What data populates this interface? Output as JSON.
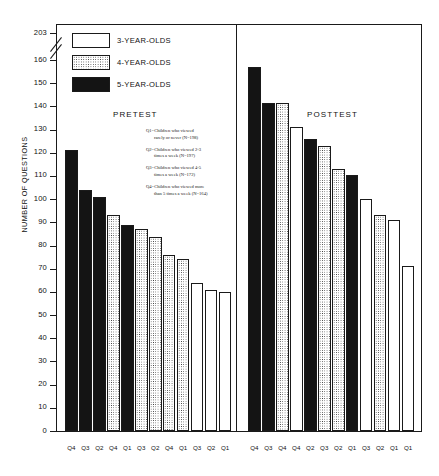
{
  "chart_data": {
    "type": "bar",
    "title": "",
    "xlabel": "",
    "ylabel": "NUMBER OF QUESTIONS",
    "ylim": [
      0,
      160
    ],
    "ytick_step": 10,
    "yticks": [
      "203",
      "160",
      "150",
      "140",
      "130",
      "120",
      "110",
      "100",
      "90",
      "80",
      "70",
      "60",
      "50",
      "40",
      "30",
      "20",
      "10",
      "0"
    ],
    "axis_break_value": "203",
    "grid": false,
    "legend_position": "upper-left-inside",
    "legend": [
      {
        "label": "3-YEAR-OLDS",
        "fill": "white"
      },
      {
        "label": "4-YEAR-OLDS",
        "fill": "dotted"
      },
      {
        "label": "5-YEAR-OLDS",
        "fill": "black"
      }
    ],
    "annotations": [
      {
        "key": "Q1",
        "line1": "Q1=Children who viewed",
        "line2": "rarely or never (N=198)"
      },
      {
        "key": "Q2",
        "line1": "Q2=Children who viewed 2-3",
        "line2": "times a week (N=197)"
      },
      {
        "key": "Q3",
        "line1": "Q3=Children who viewed 4-5",
        "line2": "times a week (N=172)"
      },
      {
        "key": "Q4",
        "line1": "Q4=Children who viewed more",
        "line2": "than 5 times a week (N=164)"
      }
    ],
    "panels": [
      {
        "name": "PRETEST",
        "categories": [
          "Q4",
          "Q3",
          "Q2",
          "Q4",
          "Q1",
          "Q3",
          "Q2",
          "Q4",
          "Q1",
          "Q3",
          "Q2",
          "Q1"
        ],
        "fills": [
          "black",
          "black",
          "black",
          "dotted",
          "black",
          "dotted",
          "dotted",
          "dotted",
          "dotted",
          "white",
          "white",
          "white"
        ],
        "values": [
          121,
          104,
          101,
          93,
          89,
          87,
          83.5,
          76,
          74,
          64,
          61,
          60
        ]
      },
      {
        "name": "POSTTEST",
        "categories": [
          "Q4",
          "Q3",
          "Q4",
          "Q4",
          "Q2",
          "Q3",
          "Q2",
          "Q1",
          "Q3",
          "Q2",
          "Q1",
          "Q1"
        ],
        "fills": [
          "black",
          "black",
          "dotted",
          "white",
          "black",
          "dotted",
          "dotted",
          "black",
          "white",
          "dotted",
          "white",
          "white"
        ],
        "values": [
          157,
          141.5,
          141.5,
          131,
          126,
          123,
          113,
          110.5,
          100,
          93,
          91,
          71
        ]
      }
    ],
    "colors": {
      "axis": "#1a1a1a",
      "bar_black": "#141414",
      "bar_white": "#ffffff",
      "bar_dot": "#2e2e2e",
      "background": "#ffffff"
    }
  }
}
